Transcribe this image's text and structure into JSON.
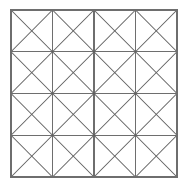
{
  "figure": {
    "background_color": "#ffffff",
    "line_color": "#6e6e6e",
    "diagonal_color": "#5f5f5f"
  },
  "chart_data": {
    "type": "diagram",
    "subtitle": "",
    "xlabel": "",
    "ylabel": "",
    "grid": true,
    "legend": false,
    "rows": 4,
    "columns": 4,
    "cell_count": 16,
    "diagonals_per_cell": 2,
    "total_diagonals": 32,
    "bounds": {
      "left": 11,
      "top": 10,
      "right": 177,
      "bottom": 177,
      "width": 166,
      "height": 167
    },
    "x_gridlines": [
      11,
      52.5,
      94,
      135.5,
      177
    ],
    "y_gridlines": [
      10,
      51.75,
      93.5,
      135.25,
      177
    ],
    "cell_width": 41.5,
    "cell_height": 41.75,
    "stroke_width": 1.1,
    "categories": [
      "row 1",
      "row 2",
      "row 3",
      "row 4"
    ],
    "values": [
      4,
      4,
      4,
      4
    ]
  }
}
